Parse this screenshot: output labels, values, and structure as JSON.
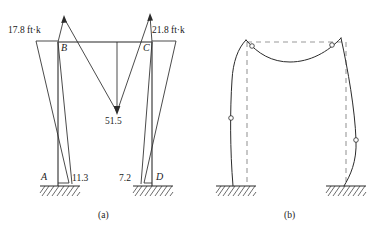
{
  "figure": {
    "width": 379,
    "height": 236,
    "background": "#ffffff",
    "ink_color": "#2b2b2b",
    "dashed_color": "#9a9a9a"
  },
  "panel_a": {
    "caption": "(a)",
    "description": "Bending moment diagram for a fixed-base portal frame ABCD",
    "joints": [
      {
        "name": "A",
        "label": "A",
        "x": 58,
        "y": 181
      },
      {
        "name": "B",
        "label": "B",
        "x": 58,
        "y": 42
      },
      {
        "name": "C",
        "label": "C",
        "x": 152,
        "y": 42
      },
      {
        "name": "D",
        "label": "D",
        "x": 152,
        "y": 181
      }
    ],
    "moment_values": [
      {
        "name": "moment-B-top",
        "value": "17.8 ft·k",
        "x": 8,
        "y": 31
      },
      {
        "name": "moment-C-top",
        "value": "21.8 ft·k",
        "x": 152,
        "y": 31
      },
      {
        "name": "moment-midspan",
        "value": "51.5",
        "x": 107,
        "y": 116
      },
      {
        "name": "moment-A-base",
        "value": "11.3",
        "x": 71,
        "y": 177
      },
      {
        "name": "moment-D-base",
        "value": "7.2",
        "x": 119,
        "y": 177
      }
    ],
    "joint_labels": [
      {
        "name": "joint-label-A",
        "label": "A",
        "x": 41,
        "y": 176
      },
      {
        "name": "joint-label-B",
        "label": "B",
        "x": 61,
        "y": 44
      },
      {
        "name": "joint-label-C",
        "label": "C",
        "x": 142,
        "y": 44
      },
      {
        "name": "joint-label-D",
        "label": "D",
        "x": 155,
        "y": 176
      }
    ]
  },
  "panel_b": {
    "caption": "(b)",
    "description": "Qualitative deflected shape of the frame with inflection points marked by small circles",
    "inflection_points": [
      {
        "name": "inflection-beam-left",
        "x": 52,
        "y": 46
      },
      {
        "name": "inflection-beam-right",
        "x": 132,
        "y": 45
      },
      {
        "name": "inflection-column-left",
        "x": 37,
        "y": 134
      },
      {
        "name": "inflection-column-right",
        "x": 161,
        "y": 146
      }
    ]
  }
}
